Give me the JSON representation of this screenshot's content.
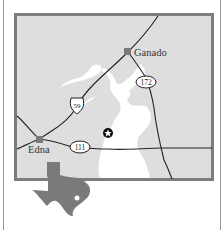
{
  "map": {
    "title": "",
    "colors": {
      "land": "#dedede",
      "frame": "#7d7d7d",
      "water": "#ffffff",
      "road": "#222222",
      "marker": "#7a7a7a",
      "texas": "#7a7a7a"
    },
    "cities": [
      {
        "name": "Ganado",
        "x": 128,
        "y": 52
      },
      {
        "name": "Edna",
        "x": 39,
        "y": 139
      }
    ],
    "routes": [
      {
        "number": "59",
        "type": "us-highway-shield",
        "x": 77,
        "y": 104
      },
      {
        "number": "172",
        "type": "state-highway-oval",
        "x": 146,
        "y": 82
      },
      {
        "number": "111",
        "type": "state-highway-oval",
        "x": 80,
        "y": 147
      }
    ],
    "points_of_interest": [
      {
        "symbol": "star-icon",
        "x": 108,
        "y": 133
      }
    ],
    "inset": {
      "label": "Texas locator",
      "marker": "white-dot"
    }
  }
}
